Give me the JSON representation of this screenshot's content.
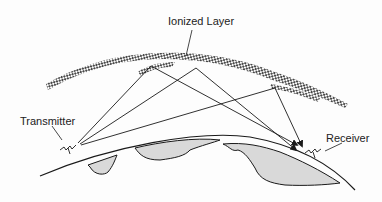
{
  "diagram": {
    "labels": {
      "ionized_layer": "Ionized Layer",
      "transmitter": "Transmitter",
      "receiver": "Receiver"
    },
    "colors": {
      "line": "#1a1a1a",
      "land_fill": "#d9d9d9",
      "hatch": "#333333",
      "background": "#fdfdfd"
    },
    "nodes": {
      "transmitter": {
        "x": 78,
        "y": 143
      },
      "receiver": {
        "x": 298,
        "y": 152
      }
    },
    "reflection_points": [
      {
        "x": 151,
        "y": 66
      },
      {
        "x": 196,
        "y": 68
      },
      {
        "x": 275,
        "y": 88
      }
    ]
  }
}
